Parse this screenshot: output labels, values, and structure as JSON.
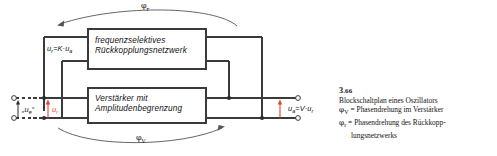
{
  "figure": {
    "blocks": [
      {
        "id": "feedback-network",
        "line1": "frequenzselektives",
        "line2": "Rückkopplungsnetzwerk"
      },
      {
        "id": "amplifier",
        "line1": "Verstärker mit",
        "line2": "Amplitudenbegrenzung"
      }
    ],
    "equations": {
      "feedback": {
        "lhs": "u",
        "lhs_sub": "r",
        "eq": "=",
        "gain": "K",
        "dot": "·",
        "rhs": "u",
        "rhs_sub": "a"
      },
      "output": {
        "lhs": "u",
        "lhs_sub": "a",
        "eq": "=",
        "gain": "V",
        "dot": "·",
        "rhs": "u",
        "rhs_sub": "r"
      }
    },
    "terminals": {
      "input_label": "„u",
      "input_sub": "e",
      "input_label_close": "“",
      "feedback_label": "u",
      "feedback_sub": "r"
    },
    "arcs": {
      "top": {
        "symbol": "φ",
        "sub": "r"
      },
      "bottom": {
        "symbol": "φ",
        "sub": "V"
      }
    },
    "colors": {
      "line": "#3a3a3a",
      "accent_red": "#e8402a",
      "text": "#141414"
    }
  },
  "caption": {
    "number": "3",
    "number_sub": ".66",
    "title": "Blockschaltplan eines Oszillators",
    "items": [
      {
        "symbol": "φ",
        "sub": "V",
        "text": "= Phasendrehung im Verstärker"
      },
      {
        "symbol": "φ",
        "sub": "r",
        "text": "= Phasendrehung des Rückkopp-"
      }
    ],
    "continuation": "lungsnetzwerks"
  }
}
